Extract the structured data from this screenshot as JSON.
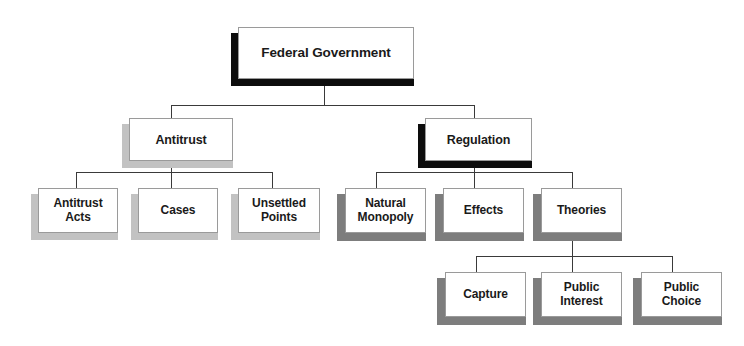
{
  "diagram": {
    "type": "organizational-tree",
    "levels": 4,
    "colors": {
      "box_fill": "#ffffff",
      "box_border": "#9a9a9a",
      "text": "#1a1a1a",
      "connector": "#3a3a3a",
      "shadow_black": "#0d0d0d",
      "shadow_light": "#c2c2c2",
      "shadow_mid": "#7d7d7d"
    },
    "nodes": {
      "root": {
        "label": "Federal Government"
      },
      "antitrust": {
        "label": "Antitrust"
      },
      "regulation": {
        "label": "Regulation"
      },
      "antitrust_acts": {
        "label": "Antitrust\nActs"
      },
      "cases": {
        "label": "Cases"
      },
      "unsettled_points": {
        "label": "Unsettled\nPoints"
      },
      "natural_monopoly": {
        "label": "Natural\nMonopoly"
      },
      "effects": {
        "label": "Effects"
      },
      "theories": {
        "label": "Theories"
      },
      "capture": {
        "label": "Capture"
      },
      "public_interest": {
        "label": "Public\nInterest"
      },
      "public_choice": {
        "label": "Public\nChoice"
      }
    },
    "edges": [
      {
        "from": "root",
        "to": "antitrust"
      },
      {
        "from": "root",
        "to": "regulation"
      },
      {
        "from": "antitrust",
        "to": "antitrust_acts"
      },
      {
        "from": "antitrust",
        "to": "cases"
      },
      {
        "from": "antitrust",
        "to": "unsettled_points"
      },
      {
        "from": "regulation",
        "to": "natural_monopoly"
      },
      {
        "from": "regulation",
        "to": "effects"
      },
      {
        "from": "regulation",
        "to": "theories"
      },
      {
        "from": "theories",
        "to": "capture"
      },
      {
        "from": "theories",
        "to": "public_interest"
      },
      {
        "from": "theories",
        "to": "public_choice"
      }
    ]
  }
}
